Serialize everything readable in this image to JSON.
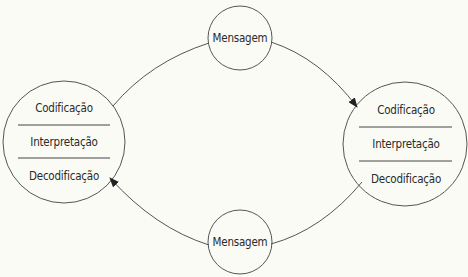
{
  "diagram": {
    "type": "communication-cycle",
    "colors": {
      "background": "#fbfbf5",
      "stroke": "#555555",
      "text": "#2a2a2a"
    },
    "left_node": {
      "sections": [
        "Codificação",
        "Interpretação",
        "Decodificação"
      ]
    },
    "right_node": {
      "sections": [
        "Codificação",
        "Interpretação",
        "Decodificação"
      ]
    },
    "top_message": {
      "label": "Mensagem"
    },
    "bottom_message": {
      "label": "Mensagem"
    },
    "edges": [
      {
        "from": "left_node",
        "to": "top_message",
        "arrow": false
      },
      {
        "from": "top_message",
        "to": "right_node",
        "arrow": true
      },
      {
        "from": "right_node",
        "to": "bottom_message",
        "arrow": false
      },
      {
        "from": "bottom_message",
        "to": "left_node",
        "arrow": true
      }
    ]
  }
}
